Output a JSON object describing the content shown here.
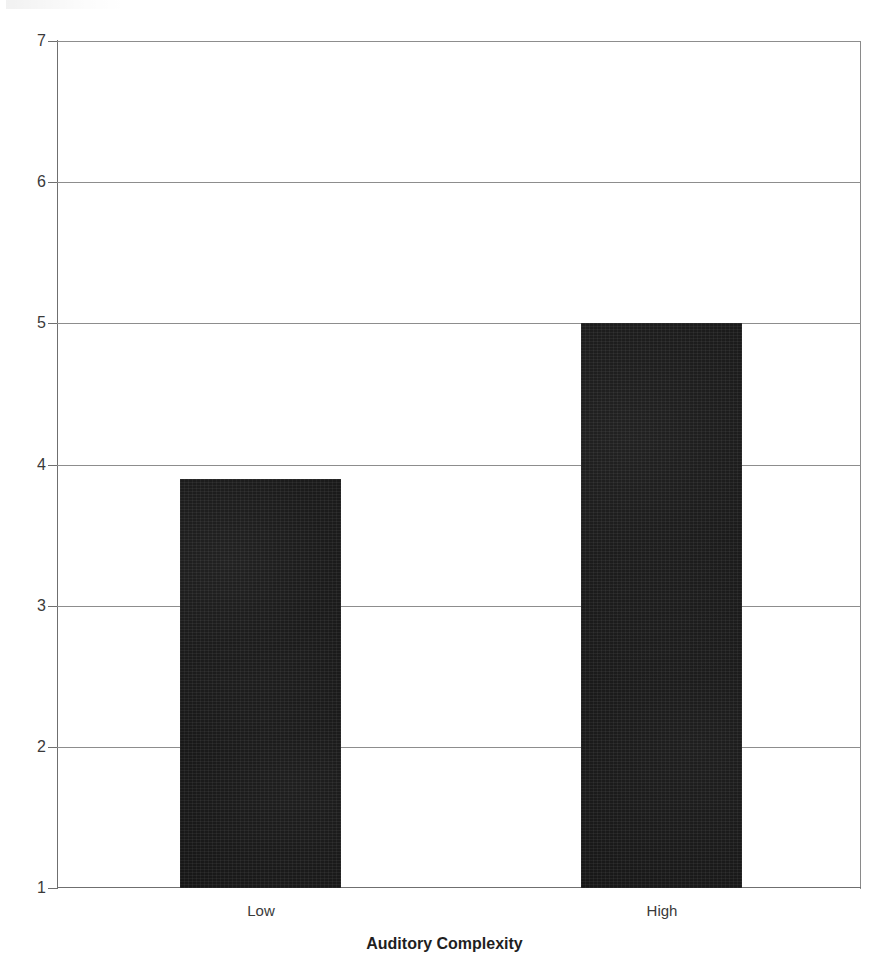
{
  "chart_data": {
    "type": "bar",
    "title": "",
    "subtitle": "",
    "xlabel": "Auditory Complexity",
    "ylabel": "",
    "categories": [
      "Low",
      "High"
    ],
    "values": [
      3.9,
      5.0
    ],
    "series": [
      {
        "name": "Rating",
        "values": [
          3.9,
          5.0
        ]
      }
    ],
    "ylim": [
      1,
      7
    ],
    "yticks": [
      7,
      6,
      5,
      4,
      3,
      2,
      1
    ],
    "ytick_labels": [
      "7",
      "6",
      "5",
      "4",
      "3",
      "2",
      "1"
    ],
    "grid": true,
    "grid_axis": "y",
    "legend": false,
    "legend_position": "none",
    "bar_color": "#161616",
    "axis_color": "#6f6f6f",
    "grid_color": "#8d8d8d",
    "annotations": []
  },
  "axis": {
    "x_title": "Auditory Complexity",
    "y_title": ""
  },
  "ticks": {
    "y": [
      "7",
      "6",
      "5",
      "4",
      "3",
      "2",
      "1"
    ],
    "x": [
      "Low",
      "High"
    ]
  }
}
